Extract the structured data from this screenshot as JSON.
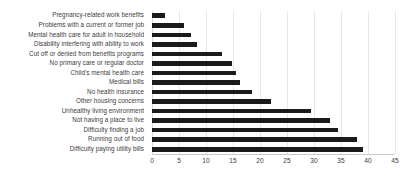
{
  "chart_data": {
    "type": "bar",
    "orientation": "horizontal",
    "title": "",
    "subtitle": "",
    "xlabel": "",
    "ylabel": "",
    "xlim": [
      0,
      45
    ],
    "xticks": [
      0,
      5,
      10,
      15,
      20,
      25,
      30,
      35,
      40,
      45
    ],
    "grid": true,
    "grid_axis": "x",
    "legend": false,
    "bar_color": "#1a1a1a",
    "gridline_color": "#e6e6e6",
    "text_color": "#3b3b3b",
    "categories": [
      "Pregnancy-related work benefits",
      "Problems with a current or former job",
      "Mental health care for adult in household",
      "Disability interfering with ability to work",
      "Cut off or denied from benefits programs",
      "No primary care or regular doctor",
      "Child's mental health care",
      "Medical bills",
      "No health insurance",
      "Other housing concerns",
      "Unhealthy living environment",
      "Not having a place to live",
      "Difficulty finding a job",
      "Running out of food",
      "Difficulty paying utility bills"
    ],
    "values": [
      2.4,
      6,
      7.2,
      8.3,
      13,
      14.8,
      15.5,
      16.3,
      18.5,
      22,
      29.5,
      33,
      34.5,
      38,
      39
    ]
  }
}
